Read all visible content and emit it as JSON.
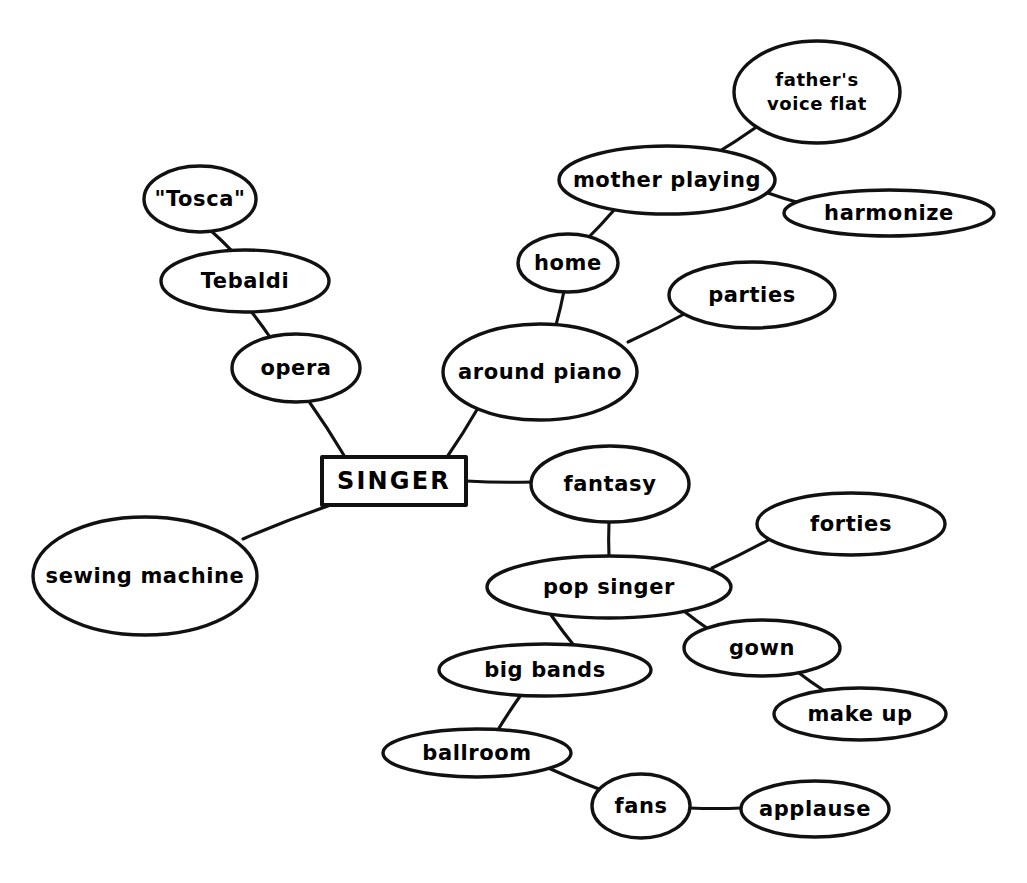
{
  "diagram": {
    "style": {
      "background": "#ffffff",
      "ink": "#111111",
      "text": "#000000"
    },
    "central": {
      "id": "singer",
      "label": "SINGER",
      "shape": "rectangle",
      "x": 394,
      "y": 481,
      "w": 144,
      "h": 48
    },
    "nodes": [
      {
        "id": "tosca",
        "label": "\"Tosca\"",
        "shape": "ellipse",
        "x": 200,
        "y": 199,
        "rx": 56,
        "ry": 33
      },
      {
        "id": "tebaldi",
        "label": "Tebaldi",
        "shape": "ellipse",
        "x": 245,
        "y": 281,
        "rx": 84,
        "ry": 31
      },
      {
        "id": "opera",
        "label": "opera",
        "shape": "ellipse",
        "x": 296,
        "y": 368,
        "rx": 64,
        "ry": 34
      },
      {
        "id": "around-piano",
        "label": "around piano",
        "shape": "ellipse",
        "x": 540,
        "y": 372,
        "rx": 97,
        "ry": 48
      },
      {
        "id": "home",
        "label": "home",
        "shape": "ellipse",
        "x": 568,
        "y": 263,
        "rx": 50,
        "ry": 29
      },
      {
        "id": "mother-playing",
        "label": "mother playing",
        "shape": "ellipse",
        "x": 667,
        "y": 180,
        "rx": 108,
        "ry": 34
      },
      {
        "id": "fathers-voice-flat",
        "label": "father's voice flat",
        "shape": "ellipse",
        "x": 817,
        "y": 92,
        "rx": 83,
        "ry": 51,
        "lines": [
          "father's",
          "voice flat"
        ]
      },
      {
        "id": "harmonize",
        "label": "harmonize",
        "shape": "ellipse",
        "x": 889,
        "y": 213,
        "rx": 105,
        "ry": 23
      },
      {
        "id": "parties",
        "label": "parties",
        "shape": "ellipse",
        "x": 752,
        "y": 295,
        "rx": 83,
        "ry": 33
      },
      {
        "id": "sewing-machine",
        "label": "sewing machine",
        "shape": "ellipse",
        "x": 145,
        "y": 576,
        "rx": 112,
        "ry": 59
      },
      {
        "id": "fantasy",
        "label": "fantasy",
        "shape": "ellipse",
        "x": 610,
        "y": 484,
        "rx": 79,
        "ry": 38
      },
      {
        "id": "pop-singer",
        "label": "pop singer",
        "shape": "ellipse",
        "x": 609,
        "y": 587,
        "rx": 122,
        "ry": 31
      },
      {
        "id": "forties",
        "label": "forties",
        "shape": "ellipse",
        "x": 851,
        "y": 524,
        "rx": 94,
        "ry": 31
      },
      {
        "id": "gown",
        "label": "gown",
        "shape": "ellipse",
        "x": 762,
        "y": 648,
        "rx": 78,
        "ry": 28
      },
      {
        "id": "make-up",
        "label": "make up",
        "shape": "ellipse",
        "x": 860,
        "y": 714,
        "rx": 86,
        "ry": 26
      },
      {
        "id": "big-bands",
        "label": "big bands",
        "shape": "ellipse",
        "x": 545,
        "y": 670,
        "rx": 106,
        "ry": 26
      },
      {
        "id": "ballroom",
        "label": "ballroom",
        "shape": "ellipse",
        "x": 477,
        "y": 753,
        "rx": 94,
        "ry": 24
      },
      {
        "id": "fans",
        "label": "fans",
        "shape": "ellipse",
        "x": 641,
        "y": 806,
        "rx": 49,
        "ry": 32
      },
      {
        "id": "applause",
        "label": "applause",
        "shape": "ellipse",
        "x": 815,
        "y": 809,
        "rx": 74,
        "ry": 28
      }
    ],
    "edges": [
      {
        "id": "edge-singer-opera",
        "from": "singer",
        "to": "opera",
        "x1": 345,
        "y1": 457,
        "x2": 308,
        "y2": 400
      },
      {
        "id": "edge-opera-tebaldi",
        "from": "opera",
        "to": "tebaldi",
        "x1": 272,
        "y1": 340,
        "x2": 250,
        "y2": 310
      },
      {
        "id": "edge-tebaldi-tosca",
        "from": "tebaldi",
        "to": "tosca",
        "x1": 236,
        "y1": 255,
        "x2": 208,
        "y2": 228
      },
      {
        "id": "edge-singer-around-piano",
        "from": "singer",
        "to": "around-piano",
        "x1": 447,
        "y1": 457,
        "x2": 478,
        "y2": 408
      },
      {
        "id": "edge-around-piano-home",
        "from": "around-piano",
        "to": "home",
        "x1": 556,
        "y1": 325,
        "x2": 564,
        "y2": 291
      },
      {
        "id": "edge-home-mother-playing",
        "from": "home",
        "to": "mother-playing",
        "x1": 586,
        "y1": 240,
        "x2": 615,
        "y2": 209
      },
      {
        "id": "edge-mother-fathers-voice",
        "from": "mother-playing",
        "to": "fathers-voice-flat",
        "x1": 715,
        "y1": 154,
        "x2": 755,
        "y2": 128
      },
      {
        "id": "edge-mother-harmonize",
        "from": "mother-playing",
        "to": "harmonize",
        "x1": 768,
        "y1": 193,
        "x2": 800,
        "y2": 203
      },
      {
        "id": "edge-around-piano-parties",
        "from": "around-piano",
        "to": "parties",
        "x1": 628,
        "y1": 342,
        "x2": 688,
        "y2": 312
      },
      {
        "id": "edge-singer-sewing-machine",
        "from": "singer",
        "to": "sewing-machine",
        "x1": 328,
        "y1": 506,
        "x2": 243,
        "y2": 539
      },
      {
        "id": "edge-singer-fantasy",
        "from": "singer",
        "to": "fantasy",
        "x1": 466,
        "y1": 481,
        "x2": 533,
        "y2": 482
      },
      {
        "id": "edge-fantasy-pop-singer",
        "from": "fantasy",
        "to": "pop-singer",
        "x1": 609,
        "y1": 522,
        "x2": 609,
        "y2": 557
      },
      {
        "id": "edge-pop-singer-forties",
        "from": "pop-singer",
        "to": "forties",
        "x1": 712,
        "y1": 568,
        "x2": 772,
        "y2": 538
      },
      {
        "id": "edge-pop-singer-gown",
        "from": "pop-singer",
        "to": "gown",
        "x1": 680,
        "y1": 608,
        "x2": 714,
        "y2": 633
      },
      {
        "id": "edge-gown-make-up",
        "from": "gown",
        "to": "make-up",
        "x1": 795,
        "y1": 670,
        "x2": 826,
        "y2": 692
      },
      {
        "id": "edge-pop-singer-big-bands",
        "from": "pop-singer",
        "to": "big-bands",
        "x1": 551,
        "y1": 615,
        "x2": 576,
        "y2": 648
      },
      {
        "id": "edge-big-bands-ballroom",
        "from": "big-bands",
        "to": "ballroom",
        "x1": 523,
        "y1": 692,
        "x2": 496,
        "y2": 733
      },
      {
        "id": "edge-ballroom-fans",
        "from": "ballroom",
        "to": "fans",
        "x1": 546,
        "y1": 767,
        "x2": 604,
        "y2": 791
      },
      {
        "id": "edge-fans-applause",
        "from": "fans",
        "to": "applause",
        "x1": 689,
        "y1": 808,
        "x2": 742,
        "y2": 808
      }
    ]
  }
}
